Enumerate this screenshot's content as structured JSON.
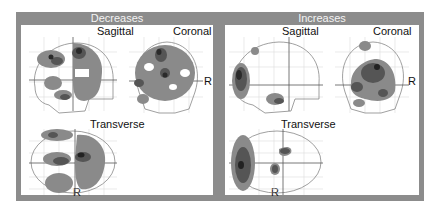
{
  "panels": [
    {
      "title": "Decreases",
      "views": {
        "sagittal": "Sagittal",
        "coronal": "Coronal",
        "transverse": "Transverse"
      },
      "orientation_labels": {
        "coronal": "R",
        "transverse": "R"
      }
    },
    {
      "title": "Increases",
      "views": {
        "sagittal": "Sagittal",
        "coronal": "Coronal",
        "transverse": "Transverse"
      },
      "orientation_labels": {
        "coronal": "R",
        "transverse": "R"
      }
    }
  ],
  "colors": {
    "frame": "#8c8c8c",
    "blob_light": "#9a9a9a",
    "blob_mid": "#6e6e6e",
    "blob_dark": "#2e2e2e",
    "grid": "#d8d8d8",
    "outline": "#7a7a7a"
  }
}
